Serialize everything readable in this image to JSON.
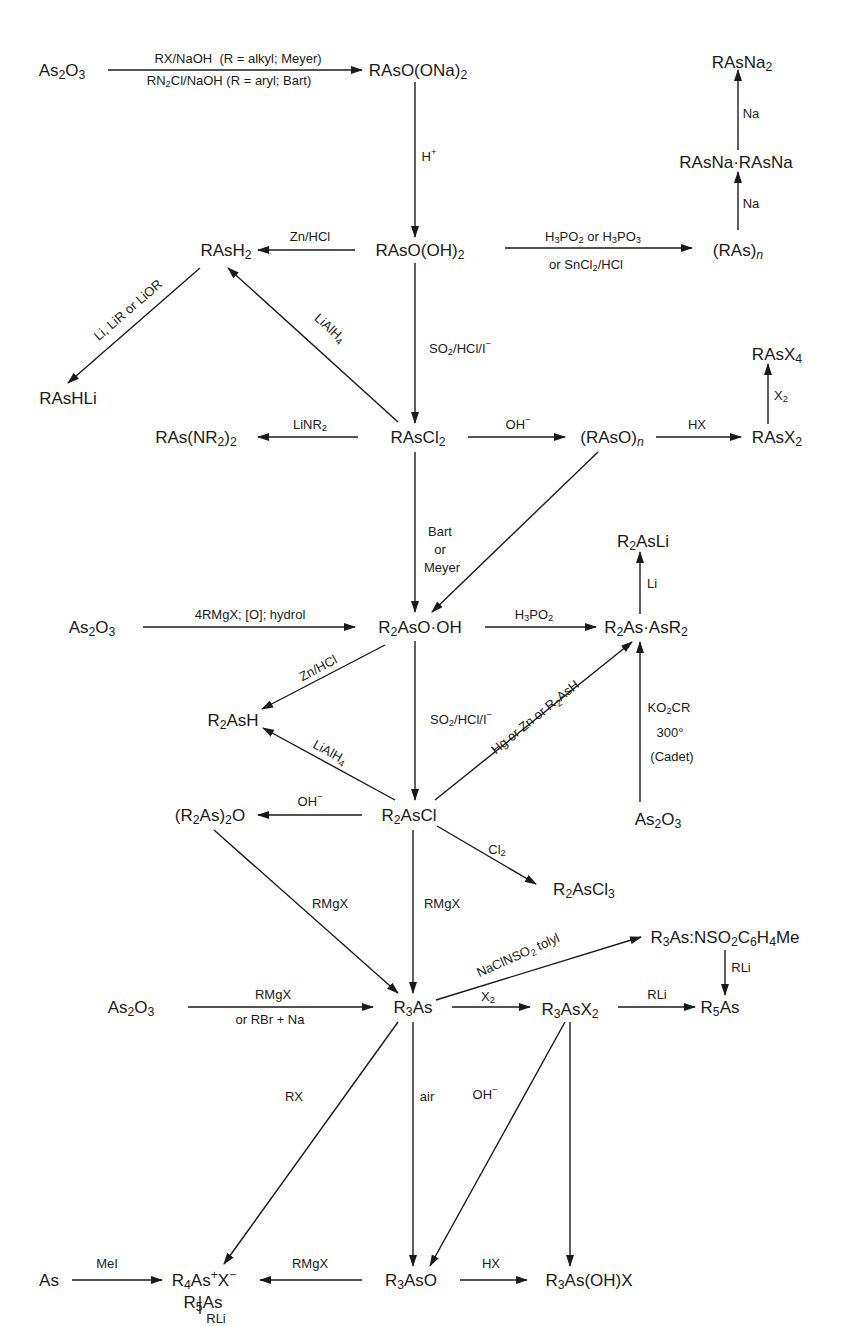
{
  "diagram": {
    "type": "reaction-scheme",
    "nodes": [
      {
        "id": "as2o3_top",
        "html": "As<sub>2</sub>O<sub>3</sub>",
        "x": 62,
        "y": 70
      },
      {
        "id": "rasoona2",
        "html": "RAsO(ONa)<sub>2</sub>",
        "x": 418,
        "y": 70
      },
      {
        "id": "rasna2",
        "html": "RAsNa<sub>2</sub>",
        "x": 742,
        "y": 62
      },
      {
        "id": "rasna_dimer",
        "html": "RAsNa·RAsNa",
        "x": 736,
        "y": 162
      },
      {
        "id": "raso_oh2",
        "html": "RAsO(OH)<sub>2</sub>",
        "x": 420,
        "y": 250
      },
      {
        "id": "rash2",
        "html": "RAsH<sub>2</sub>",
        "x": 226,
        "y": 250
      },
      {
        "id": "ras_n",
        "html": "(RAs)<sub><i>n</i></sub>",
        "x": 738,
        "y": 250
      },
      {
        "id": "rashli",
        "html": "RAsHLi",
        "x": 68,
        "y": 398
      },
      {
        "id": "ras_nr2_2",
        "html": "RAs(NR<sub>2</sub>)<sub>2</sub>",
        "x": 196,
        "y": 437
      },
      {
        "id": "rascl2",
        "html": "RAsCl<sub>2</sub>",
        "x": 418,
        "y": 437
      },
      {
        "id": "raso_n",
        "html": "(RAsO)<sub><i>n</i></sub>",
        "x": 612,
        "y": 437
      },
      {
        "id": "rasx2",
        "html": "RAsX<sub>2</sub>",
        "x": 777,
        "y": 437
      },
      {
        "id": "rasx4",
        "html": "RAsX<sub>4</sub>",
        "x": 777,
        "y": 354
      },
      {
        "id": "r2asli",
        "html": "R<sub>2</sub>AsLi",
        "x": 643,
        "y": 541
      },
      {
        "id": "as2o3_mid",
        "html": "As<sub>2</sub>O<sub>3</sub>",
        "x": 92,
        "y": 627
      },
      {
        "id": "r2aso_oh",
        "html": "R<sub>2</sub>AsO·OH",
        "x": 420,
        "y": 627
      },
      {
        "id": "r2as_asr2",
        "html": "R<sub>2</sub>As·AsR<sub>2</sub>",
        "x": 646,
        "y": 627
      },
      {
        "id": "r2ash",
        "html": "R<sub>2</sub>AsH",
        "x": 233,
        "y": 720
      },
      {
        "id": "r2ascl",
        "html": "R<sub>2</sub>AsCl",
        "x": 409,
        "y": 815
      },
      {
        "id": "r2as_2o",
        "html": "(R<sub>2</sub>As)<sub>2</sub>O",
        "x": 210,
        "y": 815
      },
      {
        "id": "as2o3_cadet",
        "html": "As<sub>2</sub>O<sub>3</sub>",
        "x": 658,
        "y": 819
      },
      {
        "id": "r2ascl3",
        "html": "R<sub>2</sub>AsCl<sub>3</sub>",
        "x": 584,
        "y": 889
      },
      {
        "id": "r3as_nso2",
        "html": "R<sub>3</sub>As:NSO<sub>2</sub>C<sub>6</sub>H<sub>4</sub>Me",
        "x": 725,
        "y": 937
      },
      {
        "id": "as2o3_low",
        "html": "As<sub>2</sub>O<sub>3</sub>",
        "x": 131,
        "y": 1007
      },
      {
        "id": "r3as",
        "html": "R<sub>3</sub>As",
        "x": 413,
        "y": 1007
      },
      {
        "id": "r3asx2",
        "html": "R<sub>3</sub>AsX<sub>2</sub>",
        "x": 570,
        "y": 1009
      },
      {
        "id": "r5as_right",
        "html": "R<sub>5</sub>As",
        "x": 720,
        "y": 1007
      },
      {
        "id": "as",
        "html": "As",
        "x": 49,
        "y": 1280
      },
      {
        "id": "r4asx",
        "html": "R<sub>4</sub>As<sup>+</sup>X<sup>−</sup>",
        "x": 204,
        "y": 1280
      },
      {
        "id": "r3aso",
        "html": "R<sub>3</sub>AsO",
        "x": 411,
        "y": 1280
      },
      {
        "id": "r3as_oh_x",
        "html": "R<sub>3</sub>As(OH)X",
        "x": 589,
        "y": 1280
      },
      {
        "id": "r5as_bottom",
        "html": "R<sub>5</sub>As",
        "x": 203,
        "y": 1356
      }
    ],
    "arrows": [
      {
        "from": "as2o3_top",
        "to": "rasoona2",
        "x1": 108,
        "y1": 70,
        "x2": 362,
        "y2": 70,
        "labels": [
          "RX/NaOH  (R = alkyl; Meyer)",
          "RN<sub>2</sub>Cl/NaOH (R = aryl; Bart)"
        ]
      },
      {
        "from": "rasoona2",
        "to": "raso_oh2",
        "x1": 415,
        "y1": 82,
        "x2": 415,
        "y2": 237,
        "labels": [
          "H<sup>+</sup>"
        ]
      },
      {
        "from": "raso_oh2",
        "to": "rash2",
        "x1": 355,
        "y1": 250,
        "x2": 258,
        "y2": 250,
        "labels": [
          "Zn/HCl"
        ]
      },
      {
        "from": "raso_oh2",
        "to": "ras_n",
        "x1": 505,
        "y1": 248,
        "x2": 692,
        "y2": 248,
        "labels": [
          "H<sub>3</sub>PO<sub>2</sub> or H<sub>3</sub>PO<sub>3</sub>",
          "or SnCl<sub>2</sub>/HCl"
        ]
      },
      {
        "from": "ras_n",
        "to": "rasna_dimer",
        "x1": 738,
        "y1": 230,
        "x2": 738,
        "y2": 172,
        "labels": [
          "Na"
        ]
      },
      {
        "from": "rasna_dimer",
        "to": "rasna2",
        "x1": 738,
        "y1": 150,
        "x2": 738,
        "y2": 70,
        "labels": [
          "Na"
        ]
      },
      {
        "from": "rash2",
        "to": "rashli",
        "x1": 200,
        "y1": 268,
        "x2": 68,
        "y2": 383,
        "labels": [
          "Li, LiR or LiOR"
        ]
      },
      {
        "from": "rascl2",
        "to": "rash2",
        "x1": 398,
        "y1": 422,
        "x2": 228,
        "y2": 268,
        "labels": [
          "LiAlH<sub>4</sub>"
        ]
      },
      {
        "from": "raso_oh2",
        "to": "rascl2",
        "x1": 415,
        "y1": 263,
        "x2": 415,
        "y2": 423,
        "labels": [
          "SO<sub>2</sub>/HCl/I<sup>−</sup>"
        ]
      },
      {
        "from": "rascl2",
        "to": "ras_nr2_2",
        "x1": 358,
        "y1": 437,
        "x2": 258,
        "y2": 437,
        "labels": [
          "LiNR<sub>2</sub>"
        ]
      },
      {
        "from": "rascl2",
        "to": "raso_n",
        "x1": 468,
        "y1": 437,
        "x2": 565,
        "y2": 437,
        "labels": [
          "OH<sup>−</sup>"
        ]
      },
      {
        "from": "raso_n",
        "to": "rasx2",
        "x1": 656,
        "y1": 437,
        "x2": 741,
        "y2": 437,
        "labels": [
          "HX"
        ]
      },
      {
        "from": "rasx2",
        "to": "rasx4",
        "x1": 768,
        "y1": 424,
        "x2": 768,
        "y2": 364,
        "labels": [
          "X<sub>2</sub>"
        ]
      },
      {
        "from": "rascl2",
        "to": "r2aso_oh",
        "x1": 415,
        "y1": 452,
        "x2": 415,
        "y2": 612,
        "labels": [
          "Bart",
          "or",
          "Meyer"
        ]
      },
      {
        "from": "raso_n",
        "to": "r2aso_oh",
        "x1": 598,
        "y1": 452,
        "x2": 432,
        "y2": 612,
        "labels": []
      },
      {
        "from": "as2o3_mid",
        "to": "r2aso_oh",
        "x1": 143,
        "y1": 627,
        "x2": 355,
        "y2": 627,
        "labels": [
          "4RMgX; [O]; hydrol"
        ]
      },
      {
        "from": "r2aso_oh",
        "to": "r2as_asr2",
        "x1": 485,
        "y1": 627,
        "x2": 596,
        "y2": 627,
        "labels": [
          "H<sub>3</sub>PO<sub>2</sub>"
        ]
      },
      {
        "from": "r2as_asr2",
        "to": "r2asli",
        "x1": 640,
        "y1": 614,
        "x2": 640,
        "y2": 552,
        "labels": [
          "Li"
        ]
      },
      {
        "from": "r2aso_oh",
        "to": "r2ash",
        "x1": 385,
        "y1": 645,
        "x2": 262,
        "y2": 709,
        "labels": [
          "Zn/HCl"
        ]
      },
      {
        "from": "r2aso_oh",
        "to": "r2ascl",
        "x1": 415,
        "y1": 641,
        "x2": 415,
        "y2": 800,
        "labels": [
          "SO<sub>2</sub>/HCl/I<sup>−</sup>"
        ]
      },
      {
        "from": "r2ascl",
        "to": "r2ash",
        "x1": 395,
        "y1": 800,
        "x2": 263,
        "y2": 728,
        "labels": [
          "LiAlH<sub>4</sub>"
        ]
      },
      {
        "from": "r2ascl",
        "to": "r2as_asr2",
        "x1": 435,
        "y1": 800,
        "x2": 632,
        "y2": 642,
        "labels": [
          "Hg or Zn or R<sub>2</sub>AsH"
        ]
      },
      {
        "from": "as2o3_cadet",
        "to": "r2as_asr2",
        "x1": 640,
        "y1": 802,
        "x2": 640,
        "y2": 642,
        "labels": [
          "KO<sub>2</sub>CR",
          "300°",
          "(Cadet)"
        ]
      },
      {
        "from": "r2ascl",
        "to": "r2as_2o",
        "x1": 362,
        "y1": 815,
        "x2": 258,
        "y2": 815,
        "labels": [
          "OH<sup>−</sup>"
        ]
      },
      {
        "from": "r2ascl",
        "to": "r2ascl3",
        "x1": 437,
        "y1": 826,
        "x2": 536,
        "y2": 884,
        "labels": [
          "Cl<sub>2</sub>"
        ]
      },
      {
        "from": "r2as_2o",
        "to": "r3as",
        "x1": 214,
        "y1": 830,
        "x2": 398,
        "y2": 993,
        "labels": [
          "RMgX"
        ]
      },
      {
        "from": "r2ascl",
        "to": "r3as",
        "x1": 413,
        "y1": 830,
        "x2": 413,
        "y2": 993,
        "labels": [
          "RMgX"
        ]
      },
      {
        "from": "r3as",
        "to": "r3as_nso2",
        "x1": 436,
        "y1": 1000,
        "x2": 641,
        "y2": 937,
        "labels": [
          "NaClNSO<sub>2</sub> tolyl"
        ]
      },
      {
        "from": "r3as_nso2",
        "to": "r5as_right",
        "x1": 725,
        "y1": 950,
        "x2": 725,
        "y2": 995,
        "labels": [
          "RLi"
        ]
      },
      {
        "from": "as2o3_low",
        "to": "r3as",
        "x1": 188,
        "y1": 1007,
        "x2": 373,
        "y2": 1007,
        "labels": [
          "RMgX",
          "or RBr + Na"
        ]
      },
      {
        "from": "r3as",
        "to": "r3asx2",
        "x1": 452,
        "y1": 1007,
        "x2": 530,
        "y2": 1007,
        "labels": [
          "X<sub>2</sub>"
        ]
      },
      {
        "from": "r3asx2",
        "to": "r5as_right",
        "x1": 618,
        "y1": 1007,
        "x2": 695,
        "y2": 1007,
        "labels": [
          "RLi"
        ]
      },
      {
        "from": "r3as",
        "to": "r4asx",
        "x1": 398,
        "y1": 1022,
        "x2": 224,
        "y2": 1264,
        "labels": [
          "RX"
        ]
      },
      {
        "from": "r3as",
        "to": "r3aso",
        "x1": 413,
        "y1": 1022,
        "x2": 413,
        "y2": 1266,
        "labels": [
          "air"
        ]
      },
      {
        "from": "r3asx2",
        "to": "r3aso",
        "x1": 565,
        "y1": 1022,
        "x2": 430,
        "y2": 1266,
        "labels": [
          "OH<sup>−</sup>"
        ]
      },
      {
        "from": "r3asx2",
        "to": "r3as_oh_x",
        "x1": 570,
        "y1": 1022,
        "x2": 570,
        "y2": 1266,
        "labels": [
          "",
          ""
        ]
      },
      {
        "from": "as",
        "to": "r4asx",
        "x1": 72,
        "y1": 1280,
        "x2": 162,
        "y2": 1280,
        "labels": [
          "MeI"
        ]
      },
      {
        "from": "r3aso",
        "to": "r4asx",
        "x1": 362,
        "y1": 1280,
        "x2": 260,
        "y2": 1280,
        "labels": [
          "RMgX"
        ]
      },
      {
        "from": "r3aso",
        "to": "r3as_oh_x",
        "x1": 460,
        "y1": 1280,
        "x2": 527,
        "y2": 1280,
        "labels": [
          "HX"
        ]
      },
      {
        "from": "r4asx",
        "to": "r5as_bottom",
        "x1": 200,
        "y1": 1296,
        "x2": 200,
        "y2": 1343,
        "labels": [
          "RLi"
        ]
      }
    ],
    "label_positions": [
      {
        "html": "RX/NaOH&nbsp;&nbsp;(R = alkyl; Meyer)",
        "x": 238,
        "y": 58,
        "cls": "reag"
      },
      {
        "html": "RN<sub>2</sub>Cl/NaOH (R = aryl; Bart)",
        "x": 229,
        "y": 80,
        "cls": "reag"
      },
      {
        "html": "H<sup>+</sup>",
        "x": 429,
        "y": 156,
        "cls": "reag"
      },
      {
        "html": "Na",
        "x": 751,
        "y": 113,
        "cls": "reag"
      },
      {
        "html": "Na",
        "x": 751,
        "y": 203,
        "cls": "reag"
      },
      {
        "html": "Zn/HCl",
        "x": 310,
        "y": 236,
        "cls": "reag"
      },
      {
        "html": "H<sub>3</sub>PO<sub>2</sub> or H<sub>3</sub>PO<sub>3</sub>",
        "x": 593,
        "y": 236,
        "cls": "reag"
      },
      {
        "html": "or SnCl<sub>2</sub>/HCl",
        "x": 586,
        "y": 264,
        "cls": "reag"
      },
      {
        "html": "SO<sub>2</sub>/HCl/I<sup>−</sup>",
        "x": 460,
        "y": 348,
        "cls": "reag"
      },
      {
        "html": "OH<sup>−</sup>",
        "x": 518,
        "y": 424,
        "cls": "reag"
      },
      {
        "html": "HX",
        "x": 697,
        "y": 424,
        "cls": "reag"
      },
      {
        "html": "X<sub>2</sub>",
        "x": 781,
        "y": 395,
        "cls": "reag"
      },
      {
        "html": "LiNR<sub>2</sub>",
        "x": 310,
        "y": 424,
        "cls": "reag"
      },
      {
        "html": "Bart",
        "x": 440,
        "y": 531,
        "cls": "reag"
      },
      {
        "html": "or",
        "x": 440,
        "y": 549,
        "cls": "reag"
      },
      {
        "html": "Meyer",
        "x": 442,
        "y": 567,
        "cls": "reag"
      },
      {
        "html": "Li",
        "x": 652,
        "y": 583,
        "cls": "reag"
      },
      {
        "html": "4RMgX; [O]; hydrol",
        "x": 250,
        "y": 614,
        "cls": "reag"
      },
      {
        "html": "H<sub>3</sub>PO<sub>2</sub>",
        "x": 534,
        "y": 614,
        "cls": "reag"
      },
      {
        "html": "SO<sub>2</sub>/HCl/I<sup>−</sup>",
        "x": 461,
        "y": 719,
        "cls": "reag"
      },
      {
        "html": "KO<sub>2</sub>CR",
        "x": 669,
        "y": 707,
        "cls": "reag"
      },
      {
        "html": "300°",
        "x": 670,
        "y": 732,
        "cls": "reag"
      },
      {
        "html": "(Cadet)",
        "x": 672,
        "y": 756,
        "cls": "reag"
      },
      {
        "html": "OH<sup>−</sup>",
        "x": 310,
        "y": 801,
        "cls": "reag"
      },
      {
        "html": "Cl<sub>2</sub>",
        "x": 497,
        "y": 849,
        "cls": "reag"
      },
      {
        "html": "RMgX",
        "x": 330,
        "y": 903,
        "cls": "reag"
      },
      {
        "html": "RMgX",
        "x": 442,
        "y": 903,
        "cls": "reag"
      },
      {
        "html": "RLi",
        "x": 741,
        "y": 967,
        "cls": "reag"
      },
      {
        "html": "RMgX",
        "x": 273,
        "y": 994,
        "cls": "reag"
      },
      {
        "html": "or RBr + Na",
        "x": 270,
        "y": 1019,
        "cls": "reag"
      },
      {
        "html": "X<sub>2</sub>",
        "x": 488,
        "y": 996,
        "cls": "reag"
      },
      {
        "html": "RLi",
        "x": 657,
        "y": 994,
        "cls": "reag"
      },
      {
        "html": "RX",
        "x": 294,
        "y": 1096,
        "cls": "reag"
      },
      {
        "html": "air",
        "x": 427,
        "y": 1096,
        "cls": "reag"
      },
      {
        "html": "OH<sup>−</sup>",
        "x": 485,
        "y": 1094,
        "cls": "reag"
      },
      {
        "html": "MeI",
        "x": 107,
        "y": 1263,
        "cls": "reag"
      },
      {
        "html": "RMgX",
        "x": 310,
        "y": 1263,
        "cls": "reag"
      },
      {
        "html": "HX",
        "x": 491,
        "y": 1263,
        "cls": "reag"
      },
      {
        "html": "RLi",
        "x": 216,
        "y": 1318,
        "cls": "reag"
      }
    ],
    "rotated_labels": [
      {
        "html": "Li, LiR or LiOR",
        "x": 128,
        "y": 310,
        "angle": -41
      },
      {
        "html": "LiAlH<sub>4</sub>",
        "x": 330,
        "y": 328,
        "angle": 42
      },
      {
        "html": "Zn/HCl",
        "x": 318,
        "y": 668,
        "angle": -28
      },
      {
        "html": "LiAlH<sub>4</sub>",
        "x": 330,
        "y": 752,
        "angle": 29
      },
      {
        "html": "Hg or Zn or R<sub>2</sub>AsH",
        "x": 535,
        "y": 717,
        "angle": -39
      },
      {
        "html": "NaClNSO<sub>2</sub> tolyl",
        "x": 518,
        "y": 955,
        "angle": -24
      }
    ]
  }
}
